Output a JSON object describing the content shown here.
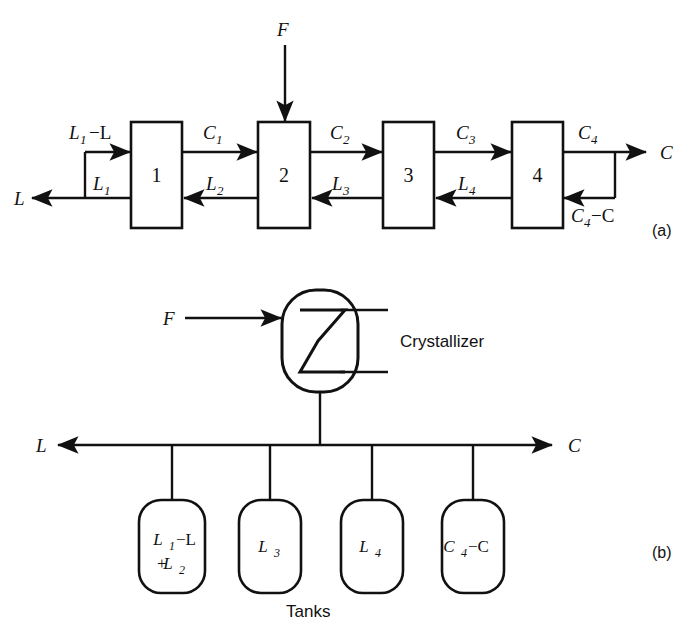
{
  "figure": {
    "panel_a_label": "(a)",
    "panel_b_label": "(b)",
    "tanks_caption": "Tanks",
    "crystallizer_label": "Crystallizer"
  },
  "panel_a": {
    "boxes": [
      {
        "number": "1"
      },
      {
        "number": "2"
      },
      {
        "number": "3"
      },
      {
        "number": "4"
      }
    ],
    "feed": {
      "base": "F",
      "sub": ""
    },
    "top_streams": [
      {
        "base": "L",
        "sub": "1",
        "op": "−L"
      },
      {
        "base": "C",
        "sub": "1",
        "op": ""
      },
      {
        "base": "C",
        "sub": "2",
        "op": ""
      },
      {
        "base": "C",
        "sub": "3",
        "op": ""
      },
      {
        "base": "C",
        "sub": "4",
        "op": ""
      }
    ],
    "bottom_streams": [
      {
        "base": "L",
        "sub": "1",
        "op": ""
      },
      {
        "base": "L",
        "sub": "2",
        "op": ""
      },
      {
        "base": "L",
        "sub": "3",
        "op": ""
      },
      {
        "base": "L",
        "sub": "4",
        "op": ""
      },
      {
        "base": "C",
        "sub": "4",
        "op": "−C"
      }
    ],
    "outlet_left": {
      "base": "L",
      "sub": ""
    },
    "outlet_right": {
      "base": "C",
      "sub": ""
    }
  },
  "panel_b": {
    "feed": {
      "base": "F",
      "sub": ""
    },
    "outlet_left": {
      "base": "L",
      "sub": ""
    },
    "outlet_right": {
      "base": "C",
      "sub": ""
    },
    "tanks": [
      {
        "line1_base": "L",
        "line1_sub": "1",
        "line1_op": " −L",
        "line2_base": "L",
        "line2_sub": "2",
        "line2_op": "+"
      },
      {
        "line1_base": "L",
        "line1_sub": "3",
        "line1_op": "",
        "line2_base": "",
        "line2_sub": "",
        "line2_op": ""
      },
      {
        "line1_base": "L",
        "line1_sub": "4",
        "line1_op": "",
        "line2_base": "",
        "line2_sub": "",
        "line2_op": ""
      },
      {
        "line1_base": "C",
        "line1_sub": "4",
        "line1_op": "−C",
        "line2_base": "",
        "line2_sub": "",
        "line2_op": ""
      }
    ]
  },
  "colors": {
    "ink": "#111111",
    "paper": "#ffffff"
  }
}
